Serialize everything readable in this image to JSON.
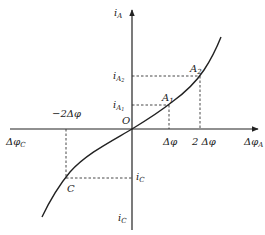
{
  "diagram": {
    "type": "characteristic-curve",
    "axes": {
      "x_positive_label": "Δφ",
      "x_positive_sub": "A",
      "x_negative_label": "Δφ",
      "x_negative_sub": "C",
      "y_positive_label": "i",
      "y_positive_sub": "A",
      "y_negative_label": "i",
      "y_negative_sub": "C",
      "origin_label": "O"
    },
    "ticks": {
      "x1": "Δφ",
      "x2": "2 Δφ",
      "xneg2": "−2Δφ",
      "iA1_main": "i",
      "iA1_sub": "A",
      "iA1_subsub": "1",
      "iA2_main": "i",
      "iA2_sub": "A",
      "iA2_subsub": "2",
      "iC_main": "i",
      "iC_sub": "C"
    },
    "points": {
      "A1_main": "A",
      "A1_sub": "1",
      "A2_main": "A",
      "A2_sub": "2",
      "C": "C"
    },
    "colors": {
      "line": "#222222",
      "background": "#ffffff"
    }
  }
}
